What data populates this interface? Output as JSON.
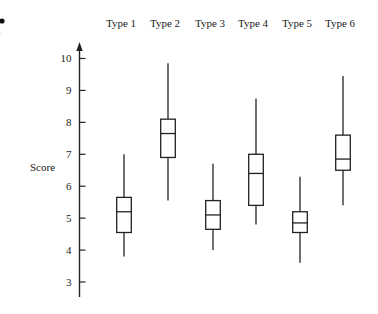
{
  "chart_data": {
    "type": "boxplot",
    "title": "",
    "xlabel": "",
    "ylabel": "Score",
    "categories": [
      "Type 1",
      "Type 2",
      "Type 3",
      "Type 4",
      "Type 5",
      "Type 6"
    ],
    "category_label_position": "top",
    "yticks": [
      3,
      4,
      5,
      6,
      7,
      8,
      9,
      10
    ],
    "ylim": [
      2.5,
      10.5
    ],
    "grid": false,
    "legend": null,
    "series": [
      {
        "name": "Type 1",
        "whisker_low": 3.8,
        "q1": 4.55,
        "median": 5.2,
        "q3": 5.65,
        "whisker_high": 7.0
      },
      {
        "name": "Type 2",
        "whisker_low": 5.55,
        "q1": 6.9,
        "median": 7.65,
        "q3": 8.1,
        "whisker_high": 9.85
      },
      {
        "name": "Type 3",
        "whisker_low": 4.0,
        "q1": 4.65,
        "median": 5.1,
        "q3": 5.55,
        "whisker_high": 6.7
      },
      {
        "name": "Type 4",
        "whisker_low": 4.8,
        "q1": 5.4,
        "median": 6.4,
        "q3": 7.0,
        "whisker_high": 8.75
      },
      {
        "name": "Type 5",
        "whisker_low": 3.6,
        "q1": 4.55,
        "median": 4.85,
        "q3": 5.2,
        "whisker_high": 6.3
      },
      {
        "name": "Type 6",
        "whisker_low": 5.4,
        "q1": 6.5,
        "median": 6.85,
        "q3": 7.6,
        "whisker_high": 9.45
      }
    ],
    "colors": {
      "stroke": "#222222",
      "fill": "#ffffff"
    }
  },
  "fragment": {
    "partial_text": "t"
  }
}
